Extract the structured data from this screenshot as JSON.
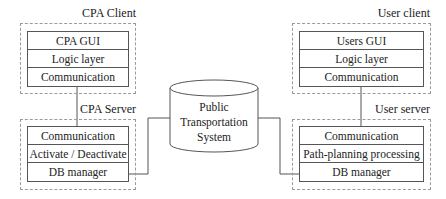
{
  "cpa_client": {
    "label": "CPA Client",
    "layers": [
      "CPA GUI",
      "Logic layer",
      "Communication"
    ]
  },
  "cpa_server": {
    "label": "CPA Server",
    "layers": [
      "Communication",
      "Activate / Deactivate",
      "DB manager"
    ]
  },
  "user_client": {
    "label": "User client",
    "layers": [
      "Users GUI",
      "Logic layer",
      "Communication"
    ]
  },
  "user_server": {
    "label": "User server",
    "layers": [
      "Communication",
      "Path-planning processing",
      "DB manager"
    ]
  },
  "database": {
    "label_line1": "Public",
    "label_line2": "Transportation",
    "label_line3": "System"
  },
  "colors": {
    "line": "#555555",
    "dashed_border": "#9a9a9a",
    "text": "#222222"
  }
}
